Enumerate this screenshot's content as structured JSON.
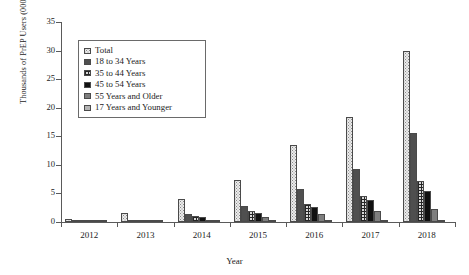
{
  "chart_data": {
    "type": "bar",
    "title": "",
    "xlabel": "Year",
    "ylabel": "Thousands of PrEP Users (000s)",
    "categories": [
      "2012",
      "2013",
      "2014",
      "2015",
      "2016",
      "2017",
      "2018"
    ],
    "ylim": [
      0,
      35
    ],
    "yticks": [
      0,
      5,
      10,
      15,
      20,
      25,
      30,
      35
    ],
    "grid": false,
    "legend_position": "upper-left-inset",
    "series": [
      {
        "name": "Total",
        "pattern": "light-dotted",
        "color": "#ececec",
        "values": [
          0.6,
          1.5,
          4.0,
          7.3,
          13.4,
          18.4,
          30.0
        ]
      },
      {
        "name": "18 to 34 Years",
        "pattern": "dark-gray-solid",
        "color": "#4f4f4f",
        "values": [
          0.1,
          0.3,
          1.4,
          2.8,
          5.7,
          9.2,
          15.6
        ]
      },
      {
        "name": "35 to 44 Years",
        "pattern": "grid-checker",
        "color": "#d8d8d8",
        "values": [
          0.1,
          0.2,
          1.1,
          1.9,
          3.2,
          4.6,
          7.1
        ]
      },
      {
        "name": "45 to 54 Years",
        "pattern": "black-solid",
        "color": "#111111",
        "values": [
          0.1,
          0.2,
          0.9,
          1.6,
          2.6,
          3.8,
          5.4
        ]
      },
      {
        "name": "55 Years and Older",
        "pattern": "medium-gray",
        "color": "#7e7e7e",
        "values": [
          0.0,
          0.1,
          0.4,
          0.9,
          1.4,
          2.0,
          2.2
        ]
      },
      {
        "name": "17 Years and Younger",
        "pattern": "light-gray",
        "color": "#b4b4b4",
        "values": [
          0.0,
          0.0,
          0.1,
          0.1,
          0.2,
          0.2,
          0.2
        ]
      }
    ]
  },
  "legend": {
    "items": [
      {
        "label": "Total"
      },
      {
        "label": "18 to 34 Years"
      },
      {
        "label": "35 to 44 Years"
      },
      {
        "label": "45 to 54 Years"
      },
      {
        "label": "55 Years and Older"
      },
      {
        "label": "17 Years and Younger"
      }
    ]
  }
}
